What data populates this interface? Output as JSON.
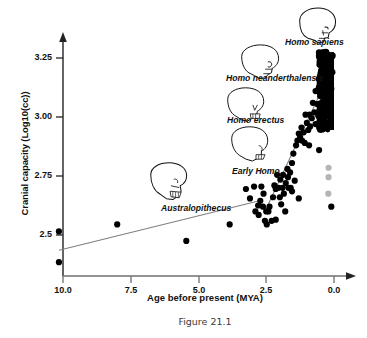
{
  "figure": {
    "caption": "Figure 21.1"
  },
  "chart_data": {
    "type": "scatter",
    "title": "",
    "xlabel": "Age before present (MYA)",
    "ylabel": "Cranial capacity (Log10(cc))",
    "xlim": [
      10.6,
      -0.35
    ],
    "ylim": [
      2.33,
      3.33
    ],
    "x_reversed": true,
    "grid": false,
    "legend": false,
    "xticks": [
      10.0,
      7.5,
      5.0,
      2.5,
      0.0
    ],
    "xticklabels": [
      "10.0",
      "7.5",
      "5.0",
      "2.5",
      "0.0"
    ],
    "yticks": [
      3.25,
      3.0,
      2.75,
      2.5
    ],
    "yticklabels": [
      "3.25",
      "3.00",
      "2.75",
      "2.5"
    ],
    "annotations": [
      {
        "label": "Homo sapiens",
        "x": 0.55,
        "y": 3.3,
        "icon": "skull-icon"
      },
      {
        "label": "Homo neanderthalensis",
        "x": 2.05,
        "y": 3.16,
        "icon": "skull-icon"
      },
      {
        "label": "Homo erectus",
        "x": 2.55,
        "y": 3.01,
        "icon": "skull-icon"
      },
      {
        "label": "Early Homo",
        "x": 2.9,
        "y": 2.845,
        "icon": "skull-icon"
      },
      {
        "label": "Australopithecus",
        "x": 4.95,
        "y": 2.66,
        "icon": "skull-icon"
      }
    ],
    "trendlines": [
      {
        "name": "australopith-trend",
        "color": "#808080",
        "x": [
          10.15,
          2.75
        ],
        "y": [
          2.435,
          2.645
        ]
      },
      {
        "name": "homo-trend",
        "color": "#808080",
        "x": [
          2.55,
          0.08
        ],
        "y": [
          2.6,
          3.205
        ]
      }
    ],
    "series": [
      {
        "name": "hominin-fossil-crania",
        "color": "#000000",
        "marker": "circle",
        "points": [
          [
            10.15,
            2.515
          ],
          [
            10.15,
            2.385
          ],
          [
            8.0,
            2.545
          ],
          [
            5.45,
            2.475
          ],
          [
            3.85,
            2.545
          ],
          [
            3.25,
            2.695
          ],
          [
            3.1,
            2.655
          ],
          [
            2.95,
            2.705
          ],
          [
            2.9,
            2.6
          ],
          [
            2.8,
            2.625
          ],
          [
            2.78,
            2.585
          ],
          [
            2.72,
            2.645
          ],
          [
            2.68,
            2.705
          ],
          [
            2.62,
            2.62
          ],
          [
            2.6,
            2.675
          ],
          [
            2.55,
            2.56
          ],
          [
            2.5,
            2.6
          ],
          [
            2.48,
            2.545
          ],
          [
            2.42,
            2.6
          ],
          [
            2.38,
            2.62
          ],
          [
            2.3,
            2.56
          ],
          [
            2.25,
            2.66
          ],
          [
            2.2,
            2.71
          ],
          [
            2.15,
            2.695
          ],
          [
            2.1,
            2.755
          ],
          [
            2.05,
            2.7
          ],
          [
            2.0,
            2.66
          ],
          [
            1.98,
            2.735
          ],
          [
            1.95,
            2.63
          ],
          [
            1.9,
            2.7
          ],
          [
            1.88,
            2.755
          ],
          [
            1.85,
            2.675
          ],
          [
            1.8,
            2.6
          ],
          [
            1.78,
            2.72
          ],
          [
            1.72,
            2.78
          ],
          [
            1.7,
            2.745
          ],
          [
            1.68,
            2.7
          ],
          [
            1.62,
            2.765
          ],
          [
            1.6,
            2.7
          ],
          [
            1.55,
            2.805
          ],
          [
            1.5,
            2.845
          ],
          [
            1.45,
            2.73
          ],
          [
            1.4,
            2.88
          ],
          [
            1.35,
            2.9
          ],
          [
            1.3,
            2.93
          ],
          [
            1.25,
            2.915
          ],
          [
            1.2,
            2.955
          ],
          [
            1.18,
            2.9
          ],
          [
            1.12,
            2.935
          ],
          [
            1.08,
            2.89
          ],
          [
            1.0,
            2.975
          ],
          [
            0.95,
            2.945
          ],
          [
            0.9,
            3.01
          ],
          [
            0.88,
            2.96
          ],
          [
            0.82,
            2.995
          ],
          [
            0.78,
            3.06
          ],
          [
            0.72,
            3.02
          ],
          [
            0.68,
            2.97
          ],
          [
            0.62,
            3.055
          ],
          [
            0.58,
            3.005
          ],
          [
            0.52,
            3.1
          ],
          [
            0.48,
            3.055
          ],
          [
            0.45,
            2.95
          ],
          [
            0.42,
            3.12
          ],
          [
            0.38,
            3.065
          ],
          [
            0.35,
            3.155
          ],
          [
            0.32,
            3.1
          ],
          [
            0.3,
            2.975
          ],
          [
            0.28,
            3.19
          ],
          [
            0.25,
            3.13
          ],
          [
            0.22,
            3.21
          ],
          [
            0.2,
            3.06
          ],
          [
            0.18,
            3.24
          ],
          [
            0.15,
            3.17
          ],
          [
            0.12,
            3.245
          ],
          [
            0.1,
            3.12
          ],
          [
            0.08,
            3.255
          ],
          [
            0.06,
            3.19
          ],
          [
            0.05,
            3.26
          ],
          [
            0.55,
            2.86
          ],
          [
            0.1,
            2.62
          ],
          [
            1.55,
            2.685
          ],
          [
            1.3,
            2.655
          ],
          [
            2.15,
            2.565
          ],
          [
            1.05,
            3.01
          ],
          [
            0.68,
            3.11
          ],
          [
            0.92,
            2.88
          ]
        ]
      },
      {
        "name": "dense-modern-cluster",
        "color": "#000000",
        "marker": "dense-band",
        "x_range": [
          0.0,
          0.3
        ],
        "y_range": [
          2.945,
          3.275
        ]
      },
      {
        "name": "gray-outlier-crania",
        "color": "#b5b5b5",
        "marker": "circle",
        "points": [
          [
            0.2,
            2.785
          ],
          [
            0.2,
            2.745
          ],
          [
            0.21,
            2.675
          ]
        ]
      }
    ]
  }
}
